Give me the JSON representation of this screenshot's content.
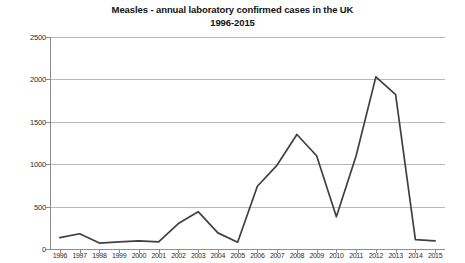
{
  "chart_data": {
    "type": "line",
    "title": "Measles - annual laboratory confirmed cases in the UK",
    "subtitle": "1996-2015",
    "xlabel": "",
    "ylabel": "",
    "ylim": [
      0,
      2500
    ],
    "ytick_labels": [
      "0",
      "500",
      "1000",
      "1500",
      "2000",
      "2500"
    ],
    "ytick_values": [
      0,
      500,
      1000,
      1500,
      2000,
      2500
    ],
    "grid": true,
    "legend": "none",
    "line_color": "#404040",
    "grid_color": "#b9b9b9",
    "background_color": "#ffffff",
    "categories": [
      "1996",
      "1997",
      "1998",
      "1999",
      "2000",
      "2001",
      "2002",
      "2003",
      "2004",
      "2005",
      "2006",
      "2007",
      "2008",
      "2009",
      "2010",
      "2011",
      "2012",
      "2013",
      "2014",
      "2015"
    ],
    "values": [
      135,
      180,
      70,
      85,
      95,
      85,
      300,
      440,
      190,
      80,
      740,
      990,
      1350,
      1100,
      380,
      1100,
      2030,
      1820,
      110,
      95
    ],
    "series": [
      {
        "name": "Annual laboratory confirmed measles cases",
        "values": [
          135,
          180,
          70,
          85,
          95,
          85,
          300,
          440,
          190,
          80,
          740,
          990,
          1350,
          1100,
          380,
          1100,
          2030,
          1820,
          110,
          95
        ]
      }
    ]
  }
}
